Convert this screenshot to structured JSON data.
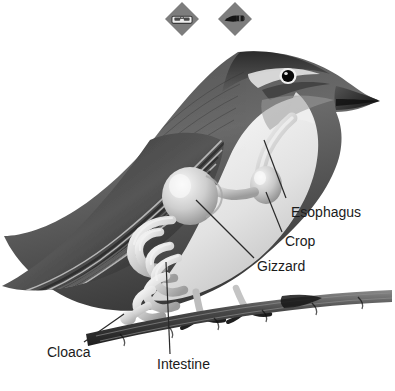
{
  "figure": {
    "background_color": "#ffffff",
    "label_color": "#1b1b1b",
    "leader_line_color": "#2a2a2a"
  },
  "toolbar": {
    "items": [
      {
        "id": "binoculars",
        "icon": "binoculars-icon",
        "badge_color": "#7d7d7d",
        "glyph_color": "#e8e8e8"
      },
      {
        "id": "scalpel",
        "icon": "scalpel-icon",
        "badge_color": "#7d7d7d",
        "glyph_color": "#141414"
      }
    ]
  },
  "labels": {
    "esophagus": "Esophagus",
    "crop": "Crop",
    "gizzard": "Gizzard",
    "cloaca": "Cloaca",
    "intestine": "Intestine"
  }
}
